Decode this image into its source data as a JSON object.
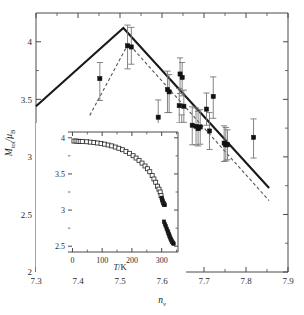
{
  "figure": {
    "background": "#ffffff",
    "line_color": "#1a1a1a",
    "marker_color": "#111111",
    "errorbar_color": "#777777",
    "dash_color": "#555555"
  },
  "main_axes": {
    "xlabel_main": "n",
    "xlabel_sub": "v",
    "ylabel_main": "M",
    "ylabel_sub": "tot",
    "ylabel_den_main": "μ",
    "ylabel_den_sub": "B",
    "ylabel_slash": "/",
    "xticks": [
      "7.3",
      "7.4",
      "7.5",
      "7.6",
      "7.7",
      "7.8",
      "7.9"
    ],
    "xtick_values": [
      7.3,
      7.4,
      7.5,
      7.6,
      7.7,
      7.8,
      7.9
    ],
    "yticks": [
      "2",
      "2.5",
      "3",
      "3.5",
      "4"
    ],
    "ytick_values": [
      2,
      2.5,
      3,
      3.5,
      4
    ],
    "xlim": [
      7.3,
      7.9
    ],
    "ylim": [
      2.0,
      4.25
    ]
  },
  "inset_axes": {
    "xlabel_main": "T",
    "xlabel_rest": "/K",
    "xticks": [
      "0",
      "100",
      "200",
      "300"
    ],
    "xtick_values": [
      0,
      100,
      200,
      300
    ],
    "yticks": [
      "2.5",
      "3",
      "3.5",
      "4"
    ],
    "ytick_values": [
      2.5,
      3,
      3.5,
      4
    ],
    "xlim": [
      -15,
      355
    ],
    "ylim": [
      2.42,
      4.08
    ]
  },
  "chart_data": [
    {
      "type": "scatter",
      "name": "main-panel",
      "title": "",
      "xlabel": "n_v",
      "ylabel": "M_tot/μ_B",
      "xlim": [
        7.3,
        7.9
      ],
      "ylim": [
        2.0,
        4.25
      ],
      "grid": false,
      "legend": "none",
      "points": [
        {
          "x": 7.452,
          "y": 3.68,
          "yerr_low": 0.19,
          "yerr_high": 0.14
        },
        {
          "x": 7.518,
          "y": 3.965,
          "yerr_low": 0.2,
          "yerr_high": 0.18
        },
        {
          "x": 7.527,
          "y": 3.955,
          "yerr_low": 0.15,
          "yerr_high": 0.17
        },
        {
          "x": 7.591,
          "y": 3.345,
          "yerr_low": 0.13,
          "yerr_high": 0.15
        },
        {
          "x": 7.613,
          "y": 3.585,
          "yerr_low": 0.2,
          "yerr_high": 0.16
        },
        {
          "x": 7.617,
          "y": 3.565,
          "yerr_low": 0.18,
          "yerr_high": 0.15
        },
        {
          "x": 7.643,
          "y": 3.72,
          "yerr_low": 0.17,
          "yerr_high": 0.14
        },
        {
          "x": 7.648,
          "y": 3.69,
          "yerr_low": 0.16,
          "yerr_high": 0.13
        },
        {
          "x": 7.641,
          "y": 3.445,
          "yerr_low": 0.15,
          "yerr_high": 0.15
        },
        {
          "x": 7.652,
          "y": 3.44,
          "yerr_low": 0.14,
          "yerr_high": 0.14
        },
        {
          "x": 7.647,
          "y": 3.225,
          "yerr_low": 0.14,
          "yerr_high": 0.14
        },
        {
          "x": 7.672,
          "y": 3.275,
          "yerr_low": 0.17,
          "yerr_high": 0.16
        },
        {
          "x": 7.681,
          "y": 3.265,
          "yerr_low": 0.16,
          "yerr_high": 0.16
        },
        {
          "x": 7.686,
          "y": 3.245,
          "yerr_low": 0.15,
          "yerr_high": 0.15
        },
        {
          "x": 7.691,
          "y": 3.26,
          "yerr_low": 0.15,
          "yerr_high": 0.15
        },
        {
          "x": 7.706,
          "y": 3.415,
          "yerr_low": 0.14,
          "yerr_high": 0.14
        },
        {
          "x": 7.713,
          "y": 3.225,
          "yerr_low": 0.16,
          "yerr_high": 0.16
        },
        {
          "x": 7.722,
          "y": 3.525,
          "yerr_low": 0.19,
          "yerr_high": 0.17
        },
        {
          "x": 7.748,
          "y": 3.12,
          "yerr_low": 0.16,
          "yerr_high": 0.15
        },
        {
          "x": 7.752,
          "y": 3.105,
          "yerr_low": 0.14,
          "yerr_high": 0.15
        },
        {
          "x": 7.756,
          "y": 3.105,
          "yerr_low": 0.13,
          "yerr_high": 0.13
        },
        {
          "x": 7.818,
          "y": 3.17,
          "yerr_low": 0.18,
          "yerr_high": 0.16
        }
      ],
      "solid_line": {
        "name": "solid-guide-line",
        "style": "solid",
        "points": [
          [
            7.3,
            3.44
          ],
          [
            7.508,
            4.12
          ],
          [
            7.855,
            2.73
          ]
        ]
      },
      "dashed_line": {
        "name": "dashed-guide-line",
        "style": "dashed",
        "points": [
          [
            7.428,
            3.36
          ],
          [
            7.52,
            3.985
          ],
          [
            7.855,
            2.62
          ]
        ]
      }
    },
    {
      "type": "scatter",
      "name": "inset-panel",
      "title": "",
      "xlabel": "T/K",
      "ylabel": "",
      "xlim": [
        -15,
        355
      ],
      "ylim": [
        2.42,
        4.08
      ],
      "grid": false,
      "legend": "none",
      "series": [
        {
          "name": "open-squares-branch",
          "marker": "open-square",
          "x": [
            5,
            12,
            19,
            26,
            33,
            48,
            60,
            72,
            84,
            96,
            108,
            120,
            132,
            144,
            156,
            168,
            180,
            192,
            204,
            214,
            224,
            234,
            244,
            252,
            260,
            268,
            274,
            280,
            286,
            291,
            295,
            298
          ],
          "y": [
            3.955,
            3.955,
            3.952,
            3.95,
            3.948,
            3.945,
            3.94,
            3.935,
            3.928,
            3.92,
            3.912,
            3.9,
            3.888,
            3.872,
            3.855,
            3.835,
            3.812,
            3.785,
            3.752,
            3.72,
            3.688,
            3.65,
            3.61,
            3.572,
            3.53,
            3.478,
            3.43,
            3.385,
            3.33,
            3.29,
            3.25,
            3.2
          ]
        },
        {
          "name": "filled-cluster-upper",
          "marker": "filled-square",
          "x": [
            300,
            301,
            302,
            303,
            304,
            305,
            306,
            307,
            308,
            309,
            310
          ],
          "y": [
            3.17,
            3.155,
            3.14,
            3.128,
            3.115,
            3.105,
            3.095,
            3.09,
            3.082,
            3.075,
            3.07
          ]
        },
        {
          "name": "filled-cluster-lower",
          "marker": "filled-square",
          "x": [
            308,
            311,
            314,
            317,
            320,
            322,
            324,
            326,
            328,
            330,
            332,
            334,
            336,
            338,
            340
          ],
          "y": [
            2.84,
            2.805,
            2.775,
            2.742,
            2.712,
            2.69,
            2.668,
            2.648,
            2.625,
            2.605,
            2.59,
            2.572,
            2.558,
            2.545,
            2.535
          ]
        }
      ]
    }
  ]
}
